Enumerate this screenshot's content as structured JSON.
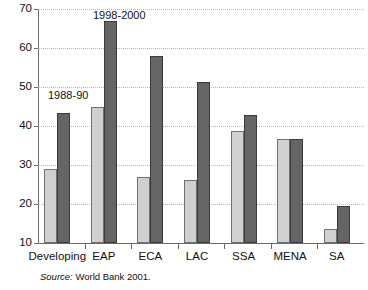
{
  "chart_data": {
    "type": "bar",
    "title": "",
    "subtitle": "",
    "xlabel": "",
    "ylabel": "",
    "ylim": [
      10,
      70
    ],
    "ytick_values": [
      10,
      20,
      30,
      40,
      50,
      60,
      70
    ],
    "ytick_labels": [
      "10",
      "20",
      "30",
      "40",
      "50",
      "60",
      "70"
    ],
    "grid": "horizontal-dotted",
    "legend_position": "inline-annotations",
    "categories": [
      "Developing",
      "EAP",
      "ECA",
      "LAC",
      "SSA",
      "MENA",
      "SA"
    ],
    "series": [
      {
        "name": "1988-90",
        "color": "#d0d0d0",
        "values": [
          29,
          45,
          27,
          26.2,
          38.7,
          36.6,
          13.5
        ]
      },
      {
        "name": "1998-2000",
        "color": "#656565",
        "values": [
          43.4,
          67,
          58,
          51.2,
          42.7,
          36.6,
          19.5
        ]
      }
    ],
    "annotations": [
      {
        "id": "ann-1988",
        "text": "1988-90"
      },
      {
        "id": "ann-1998",
        "text": "1998-2000"
      }
    ],
    "source_prefix": "Source:",
    "source_text": "World Bank 2001."
  }
}
